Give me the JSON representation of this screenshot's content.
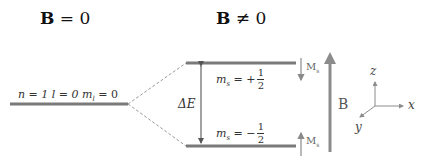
{
  "headings": {
    "left": {
      "symbol": "B",
      "relation": " = 0"
    },
    "right": {
      "symbol": "B",
      "relation": " ≠ 0"
    }
  },
  "levels": {
    "unsplit": {
      "label": "n = 1  l = 0  m",
      "label_sub": "l",
      "label_tail": " = 0"
    },
    "upper": {
      "label": "m",
      "label_sub": "s",
      "label_mid": " = +",
      "num": "1",
      "den": "2"
    },
    "lower": {
      "label": "m",
      "label_sub": "s",
      "label_mid": " = −",
      "num": "1",
      "den": "2"
    }
  },
  "gap_label": "ΔE",
  "moment_labels": {
    "upper": {
      "text": "M",
      "sub": "s"
    },
    "lower": {
      "text": "M",
      "sub": "s"
    }
  },
  "field_label": "B",
  "axes": {
    "x": "x",
    "y": "y",
    "z": "z"
  },
  "colors": {
    "level_line": "#7a7a7a",
    "dashed": "#9a9a9a",
    "arrow": "#8a8a8a",
    "field_arrow": "#8c8c8c"
  }
}
